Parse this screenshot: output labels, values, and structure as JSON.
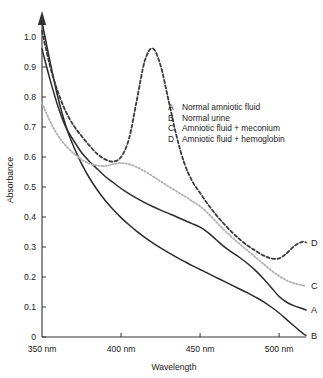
{
  "chart_data": {
    "type": "line",
    "title": "",
    "xlabel": "Wavelength",
    "ylabel": "Absorbance",
    "xlim": [
      350,
      517
    ],
    "ylim": [
      0,
      1.05
    ],
    "grid": false,
    "legend_position": "inside-upper-right",
    "xticks": [
      350,
      400,
      450,
      500
    ],
    "xticklabels": [
      "350 nm",
      "400 nm",
      "450 nm",
      "500 nm"
    ],
    "yticks": [
      0,
      0.1,
      0.2,
      0.3,
      0.4,
      0.5,
      0.6,
      0.7,
      0.8,
      0.9,
      1.0
    ],
    "yticklabels": [
      "0",
      "0.1",
      "0.2",
      "0.3",
      "0.4",
      "0.5",
      "0.6",
      "0.7",
      "0.8",
      "0.9",
      "1.0"
    ],
    "x": [
      350,
      355,
      360,
      365,
      370,
      375,
      380,
      385,
      390,
      395,
      400,
      405,
      410,
      415,
      420,
      425,
      430,
      435,
      440,
      445,
      450,
      455,
      460,
      465,
      470,
      475,
      480,
      485,
      490,
      495,
      500,
      505,
      510,
      515,
      517
    ],
    "series": [
      {
        "name": "A",
        "key": "A",
        "label": "Normal amniotic fluid",
        "style": "solid",
        "color": "#2b2b2b",
        "width": 1.5,
        "end_label": "A",
        "end_value": 0.09,
        "values": [
          0.96,
          0.86,
          0.77,
          0.7,
          0.655,
          0.615,
          0.585,
          0.56,
          0.535,
          0.515,
          0.495,
          0.478,
          0.462,
          0.448,
          0.435,
          0.423,
          0.412,
          0.401,
          0.389,
          0.378,
          0.366,
          0.348,
          0.325,
          0.302,
          0.283,
          0.265,
          0.245,
          0.222,
          0.195,
          0.165,
          0.135,
          0.115,
          0.103,
          0.094,
          0.09
        ]
      },
      {
        "name": "B",
        "key": "B",
        "label": "Normal urine",
        "style": "solid",
        "color": "#2b2b2b",
        "width": 1.5,
        "end_label": "B",
        "end_value": 0.005,
        "values": [
          1.05,
          0.92,
          0.8,
          0.705,
          0.635,
          0.578,
          0.53,
          0.49,
          0.455,
          0.425,
          0.398,
          0.374,
          0.352,
          0.332,
          0.314,
          0.297,
          0.281,
          0.266,
          0.252,
          0.238,
          0.225,
          0.212,
          0.199,
          0.186,
          0.173,
          0.16,
          0.147,
          0.133,
          0.118,
          0.1,
          0.08,
          0.057,
          0.034,
          0.012,
          0.005
        ]
      },
      {
        "name": "C",
        "key": "C",
        "label": "Amniotic fluid  +  meconium",
        "style": "dotted",
        "color": "#b0b0b0",
        "width": 1.8,
        "end_label": "C",
        "end_value": 0.17,
        "values": [
          0.78,
          0.72,
          0.672,
          0.638,
          0.612,
          0.592,
          0.578,
          0.572,
          0.57,
          0.576,
          0.58,
          0.576,
          0.566,
          0.552,
          0.536,
          0.519,
          0.502,
          0.486,
          0.47,
          0.453,
          0.436,
          0.412,
          0.385,
          0.358,
          0.333,
          0.31,
          0.288,
          0.266,
          0.244,
          0.222,
          0.203,
          0.188,
          0.178,
          0.172,
          0.17
        ]
      },
      {
        "name": "D",
        "key": "D",
        "label": "Amniotic fluid  +  hemoglobin",
        "style": "dashed",
        "color": "#3a3a3a",
        "width": 1.8,
        "end_label": "D",
        "end_value": 0.3,
        "values": [
          1.02,
          0.905,
          0.818,
          0.752,
          0.705,
          0.67,
          0.638,
          0.61,
          0.592,
          0.585,
          0.6,
          0.66,
          0.79,
          0.92,
          0.962,
          0.905,
          0.79,
          0.672,
          0.58,
          0.52,
          0.48,
          0.442,
          0.408,
          0.378,
          0.35,
          0.326,
          0.305,
          0.288,
          0.272,
          0.262,
          0.262,
          0.28,
          0.305,
          0.318,
          0.315
        ]
      }
    ],
    "legend": [
      {
        "key": "A",
        "label": "Normal amniotic fluid"
      },
      {
        "key": "B",
        "label": "Normal urine"
      },
      {
        "key": "C",
        "label": "Amniotic fluid  +  meconium"
      },
      {
        "key": "D",
        "label": "Amniotic fluid  +  hemoglobin"
      }
    ]
  }
}
